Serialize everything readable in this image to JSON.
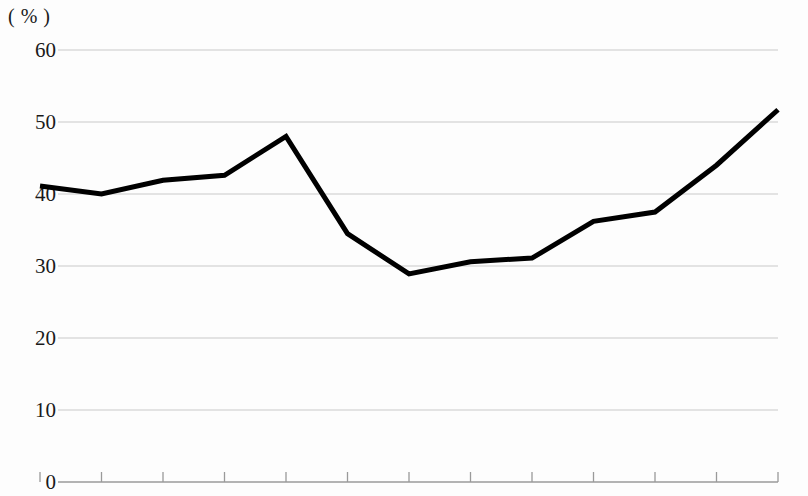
{
  "chart_data": {
    "type": "line",
    "title": "",
    "subtitle": "",
    "xlabel": "",
    "ylabel": "",
    "unit_label": "( % )",
    "ylim": [
      0,
      60
    ],
    "y_ticks": [
      0,
      10,
      20,
      30,
      40,
      50,
      60
    ],
    "y_tick_labels": [
      "0",
      "10",
      "20",
      "30",
      "40",
      "50",
      "60"
    ],
    "grid": true,
    "grid_axis": "y",
    "legend": false,
    "legend_position": "none",
    "x_tick_labels": [
      "",
      "",
      "",
      "",
      "",
      "",
      "",
      "",
      "",
      "",
      "",
      "",
      ""
    ],
    "x_tick_count": 13,
    "x": [
      0,
      1,
      2,
      3,
      4,
      5,
      6,
      7,
      8,
      9,
      10,
      11,
      12
    ],
    "values": [
      41.1,
      40.0,
      41.9,
      42.6,
      48.0,
      34.5,
      28.9,
      30.6,
      31.1,
      36.2,
      37.5,
      44.0,
      51.7
    ],
    "series": [
      {
        "name": "series-1",
        "color": "#000000",
        "values": [
          41.1,
          40.0,
          41.9,
          42.6,
          48.0,
          34.5,
          28.9,
          30.6,
          31.1,
          36.2,
          37.5,
          44.0,
          51.7
        ]
      }
    ],
    "colors": {
      "line": "#000000",
      "grid": "#c9c9c9",
      "axis": "#9a9a9a",
      "background": "#fdfdfd",
      "text": "#1a1a1a"
    },
    "line_width": 5
  }
}
